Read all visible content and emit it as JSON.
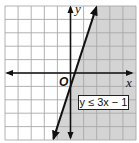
{
  "chart_data": {
    "type": "inequality-graph",
    "title": "",
    "inequality": "y ≤ 3x − 1",
    "boundary_line": {
      "slope": 3,
      "intercept": -1,
      "style": "solid"
    },
    "shaded_region": "below/right of line (y ≤ 3x − 1)",
    "xlabel": "x",
    "ylabel": "y",
    "origin_label": "O",
    "xlim": [
      -5,
      5
    ],
    "ylim": [
      -5,
      5
    ],
    "grid": true,
    "grid_step": 1
  },
  "labels": {
    "x_axis": "x",
    "y_axis": "y",
    "origin": "O",
    "inequality": "y ≤ 3x − 1"
  },
  "colors": {
    "shade": "#d4d4d4",
    "grid": "#a9a9a9",
    "axis": "#111111",
    "line": "#111111",
    "background": "#ffffff"
  }
}
